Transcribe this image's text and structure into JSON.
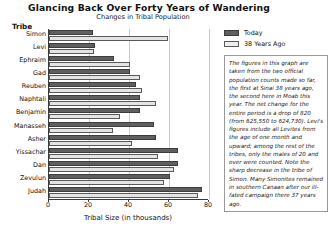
{
  "chart_data": {
    "type": "bar",
    "orientation": "horizontal",
    "title": "Glancing Back Over Forty Years of Wandering",
    "subtitle": "Changes in Tribal Population",
    "xlabel": "Tribal Size (in thousands)",
    "ylabel": "Tribe",
    "xlim": [
      0,
      80
    ],
    "xticks": [
      0,
      20,
      40,
      60,
      80
    ],
    "xtick_labels": [
      "0",
      "20",
      "40",
      "60",
      "80"
    ],
    "grid": true,
    "grid_axis": "x",
    "legend_position": "right",
    "categories": [
      "Simon",
      "Levi",
      "Ephraim",
      "Gad",
      "Reuben",
      "Naphtali",
      "Benjamin",
      "Manasseh",
      "Asher",
      "Yissachar",
      "Dan",
      "Zevulun",
      "Judah"
    ],
    "series": [
      {
        "name": "Today",
        "color": "#5f5f5f",
        "values": [
          22.2,
          23.0,
          32.5,
          40.5,
          43.7,
          45.4,
          45.6,
          52.7,
          53.4,
          64.3,
          64.4,
          60.5,
          76.5
        ]
      },
      {
        "name": "38 Years Ago",
        "color": "#e4e4e4",
        "values": [
          59.3,
          22.3,
          40.5,
          45.6,
          46.5,
          53.4,
          35.4,
          32.2,
          41.5,
          54.4,
          62.7,
          57.4,
          74.6
        ]
      }
    ]
  },
  "legend": {
    "entries": [
      {
        "label": "Today",
        "swatch": "today"
      },
      {
        "label": "38 Years Ago",
        "swatch": "past"
      }
    ]
  },
  "note": {
    "text": "The figures in this graph are taken from the two official population counts made so far, the first at Sinai 38 years ago, the second here in Moab this year. The net change for the entire period is a drop of 820 (from 625,550 to 624,730). Levi's figures include all Levites from the age of one month and upward; among the rest of the tribes, only the males of 20 and over were counted. Note the sharp decrease in the tribe of Simon. Many Simonites remained in southern Canaan after our ill-fated campaign there 37 years ago."
  }
}
